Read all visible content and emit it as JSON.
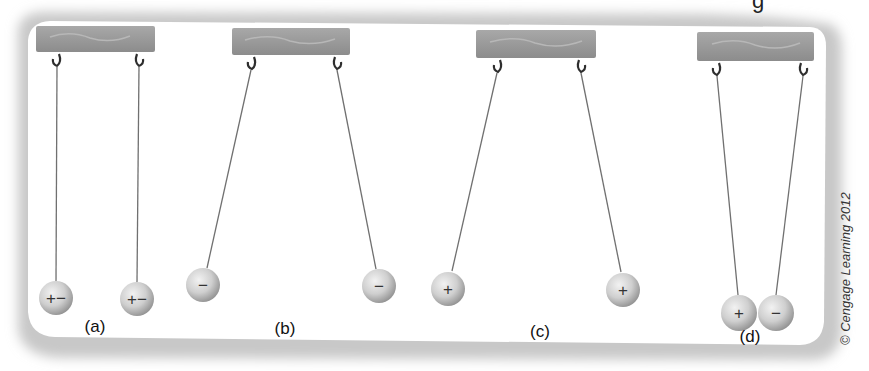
{
  "figure": {
    "top_partial_glyph": "g",
    "copyright": "© Cengage Learning 2012",
    "colors": {
      "panel_bg": "#ffffff",
      "panel_shadow": "#bdbdbd",
      "support_bar": "#9a9a9a",
      "string": "#6a6a6a",
      "sphere_light": "#e4e4e4",
      "sphere_dark": "#9c9c9c",
      "hook": "#3a3a3a",
      "label": "#111111"
    },
    "panels": [
      {
        "id": "a",
        "label": "(a)",
        "description": "Neutral spheres hang straight down",
        "balls": [
          {
            "charge_text": "+−",
            "charge": "neutral"
          },
          {
            "charge_text": "+−",
            "charge": "neutral"
          }
        ]
      },
      {
        "id": "b",
        "label": "(b)",
        "description": "Two negative spheres repel",
        "balls": [
          {
            "charge_text": "−",
            "charge": "negative"
          },
          {
            "charge_text": "−",
            "charge": "negative"
          }
        ]
      },
      {
        "id": "c",
        "label": "(c)",
        "description": "Two positive spheres repel",
        "balls": [
          {
            "charge_text": "+",
            "charge": "positive"
          },
          {
            "charge_text": "+",
            "charge": "positive"
          }
        ]
      },
      {
        "id": "d",
        "label": "(d)",
        "description": "Opposite charges attract",
        "balls": [
          {
            "charge_text": "+",
            "charge": "positive"
          },
          {
            "charge_text": "−",
            "charge": "negative"
          }
        ]
      }
    ]
  }
}
